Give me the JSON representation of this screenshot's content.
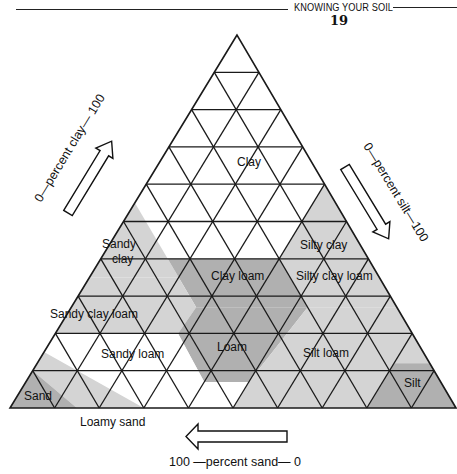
{
  "header": {
    "title": "KNOWING YOUR SOIL",
    "page_number": "19"
  },
  "diagram": {
    "colors": {
      "grid_line": "#1a1a1a",
      "fill_light": "#d4d4d4",
      "fill_mid": "#c6c6c6",
      "fill_dark": "#b0b0b0",
      "fill_white": "#ffffff"
    },
    "axes": {
      "clay": "0—percent clay— 100",
      "silt": "0—percent silt—100",
      "sand": "100 —percent sand— 0"
    },
    "regions": [
      {
        "name": "clay",
        "label": "Clay",
        "shade": "white"
      },
      {
        "name": "sandy-clay",
        "label_line1": "Sandy",
        "label_line2": "clay",
        "shade": "light"
      },
      {
        "name": "silty-clay",
        "label": "Silty clay",
        "shade": "light"
      },
      {
        "name": "clay-loam",
        "label": "Clay loam",
        "shade": "dark"
      },
      {
        "name": "silty-clay-loam",
        "label": "Silty clay loam",
        "shade": "light"
      },
      {
        "name": "sandy-clay-loam",
        "label": "Sandy clay loam",
        "shade": "light"
      },
      {
        "name": "loam",
        "label": "Loam",
        "shade": "dark"
      },
      {
        "name": "silt-loam",
        "label": "Silt loam",
        "shade": "light"
      },
      {
        "name": "sandy-loam",
        "label": "Sandy loam",
        "shade": "white"
      },
      {
        "name": "loamy-sand",
        "label": "Loamy sand",
        "shade": "light"
      },
      {
        "name": "sand",
        "label": "Sand",
        "shade": "dark"
      },
      {
        "name": "silt",
        "label": "Silt",
        "shade": "dark"
      }
    ]
  }
}
